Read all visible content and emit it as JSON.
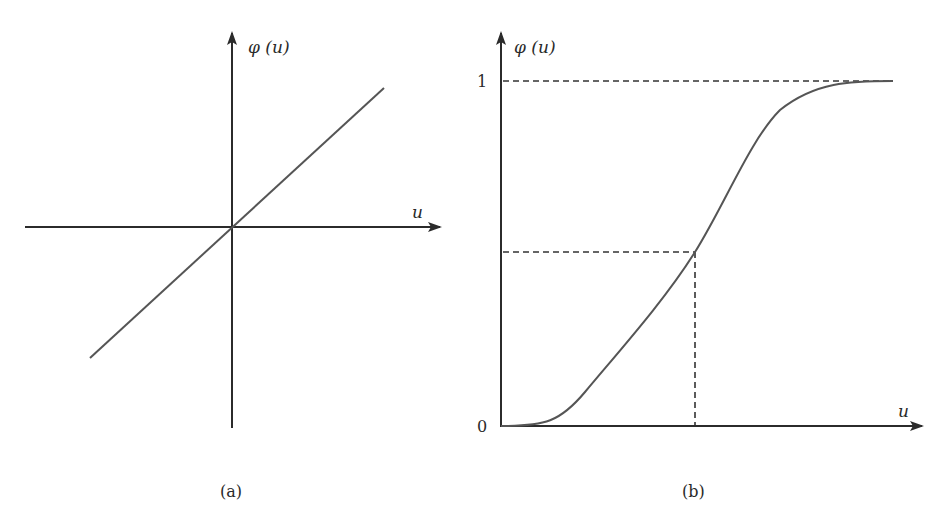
{
  "figure": {
    "panel_a": {
      "caption": "(a)",
      "y_axis_label": "φ (u)",
      "x_axis_label": "u",
      "curve": "linear",
      "description": "Linear activation function passing through origin"
    },
    "panel_b": {
      "caption": "(b)",
      "y_axis_label": "φ (u)",
      "x_axis_label": "u",
      "y_tick_top": "1",
      "y_tick_origin": "0",
      "curve": "sigmoid",
      "description": "Sigmoid activation function saturating at 1, with dashed guide lines at the midpoint and at level 1"
    },
    "colors": {
      "axis": "#2b2b2b",
      "curve": "#555555",
      "dashed": "#333333",
      "background": "#ffffff"
    }
  }
}
